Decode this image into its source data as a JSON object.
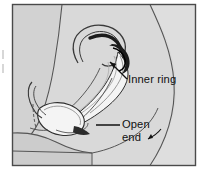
{
  "figure": {
    "name": "female-condom-placement-diagram",
    "kind": "anatomical-line-illustration",
    "frame": {
      "border_color": "#4a4a4a",
      "background_color": "#d6d6d6"
    },
    "palette": {
      "page_background": "#ffffff",
      "body_fill": "#d4d4d4",
      "body_fill_light": "#dcdcdc",
      "torso_fill": "#cfcfcf",
      "thigh_fill": "#cbcbcb",
      "condom_fill": "#f2f2f2",
      "condom_shadow": "#9b9b9b",
      "ring_dark": "#1c1c1c",
      "outline": "#2b2b2b",
      "label_color": "#111111",
      "leader_color": "#111111",
      "edge_mark": "#b8b8b8"
    }
  },
  "labels": {
    "inner_ring": {
      "text": "Inner ring",
      "x": 128,
      "y": 83
    },
    "open_end_line1": {
      "text": "Open",
      "x": 122,
      "y": 128
    },
    "open_end_line2": {
      "text": "end",
      "x": 122,
      "y": 141
    }
  },
  "annotations": {
    "inner_ring_leader": "arrow pointing up-left from the Inner ring label to the condom inner ring",
    "open_end_leader": "horizontal line from the Open end label to the condom outer open end",
    "open_end_pointer": "short angled tick to the right of the word end"
  }
}
